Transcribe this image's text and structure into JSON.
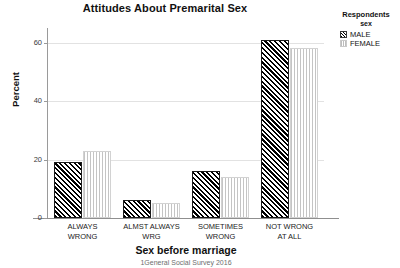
{
  "chart_data": {
    "type": "bar",
    "title": "Attitudes About Premarital Sex",
    "xlabel": "Sex before marriage",
    "ylabel": "Percent",
    "footnote": "1General Social Survey 2016",
    "categories": [
      "ALWAYS WRONG",
      "ALMST ALWAYS WRG",
      "SOMETIMES WRONG",
      "NOT WRONG AT ALL"
    ],
    "category_lines": [
      [
        "ALWAYS",
        "WRONG"
      ],
      [
        "ALMST ALWAYS",
        "WRG"
      ],
      [
        "SOMETIMES",
        "WRONG"
      ],
      [
        "NOT WRONG",
        "AT ALL"
      ]
    ],
    "series": [
      {
        "name": "MALE",
        "values": [
          19,
          6,
          16,
          61
        ]
      },
      {
        "name": "FEMALE",
        "values": [
          23,
          5,
          14,
          58
        ]
      }
    ],
    "ylim": [
      0,
      65
    ],
    "yticks": [
      0,
      20,
      40,
      60
    ],
    "ytick_labels": [
      "0",
      "20",
      "40",
      "60"
    ],
    "grid": true,
    "legend_position": "right",
    "colors": {
      "male_fill": "#000000",
      "female_fill": "#c4c4c4",
      "axis": "#8f8f8f",
      "grid": "#e2e2e2"
    }
  },
  "legend": {
    "title": "Respondents",
    "subtitle": "sex",
    "items": [
      {
        "label": "MALE"
      },
      {
        "label": "FEMALE"
      }
    ]
  }
}
